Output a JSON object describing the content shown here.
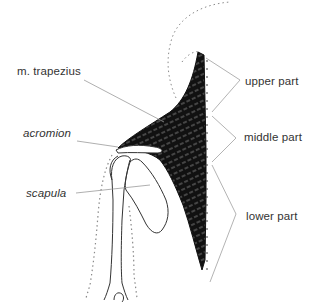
{
  "diagram": {
    "type": "anatomical-illustration",
    "colors": {
      "background": "#ffffff",
      "muscle": "#111111",
      "bone_outline": "#333333",
      "leader_line": "#9a9a9a",
      "dotted_outline": "#8a8a8a",
      "text": "#333333"
    }
  },
  "labels": {
    "trapezius": {
      "text": "m. trapezius",
      "italic": false
    },
    "acromion": {
      "text": "acromion",
      "italic": true
    },
    "scapula": {
      "text": "scapula",
      "italic": true
    },
    "upper_part": {
      "text": "upper part"
    },
    "middle_part": {
      "text": "middle part"
    },
    "lower_part": {
      "text": "lower part"
    }
  }
}
